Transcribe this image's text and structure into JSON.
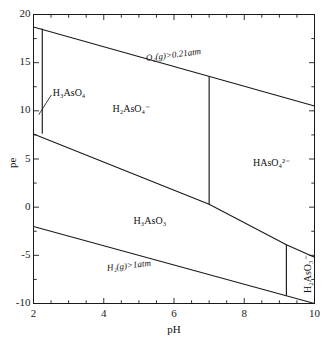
{
  "figure": {
    "ghost_text_top": "",
    "background": "#ffffff",
    "line_color": "#1a1a1a",
    "text_color": "#111111"
  },
  "chart_data": {
    "type": "line",
    "title": "",
    "subtitle": "",
    "xlabel": "pH",
    "ylabel": "pe",
    "xlim": [
      2,
      10
    ],
    "ylim": [
      -10,
      20
    ],
    "xticks": [
      2,
      4,
      6,
      8,
      10
    ],
    "xtick_labels": [
      "2",
      "4",
      "6",
      "8",
      "10"
    ],
    "yticks": [
      -10,
      -5,
      0,
      5,
      10,
      15,
      20
    ],
    "ytick_labels": [
      "-10",
      "-5",
      "0",
      "5",
      "10",
      "15",
      "20"
    ],
    "x_minor_step": 0.5,
    "y_minor_step": 2.5,
    "grid": false,
    "legend": "none",
    "series": [
      {
        "name": "O2(g) stability upper boundary",
        "style": "solid",
        "points": [
          [
            2,
            18.7
          ],
          [
            10,
            10.5
          ]
        ]
      },
      {
        "name": "H2(g) stability lower boundary",
        "style": "solid",
        "points": [
          [
            2,
            -2.0
          ],
          [
            10,
            -10.0
          ]
        ]
      },
      {
        "name": "As(V)/As(III) redox boundary",
        "style": "solid",
        "points": [
          [
            2,
            7.6
          ],
          [
            7.0,
            0.3
          ],
          [
            9.2,
            -3.9
          ],
          [
            10,
            -5.2
          ]
        ]
      },
      {
        "name": "H3AsO4 / H2AsO4- boundary (pKa1)",
        "style": "solid",
        "points": [
          [
            2.25,
            18.55
          ],
          [
            2.25,
            7.62
          ]
        ]
      },
      {
        "name": "H2AsO4- / HAsO4 2- boundary (pKa2)",
        "style": "solid",
        "points": [
          [
            7.0,
            13.6
          ],
          [
            7.0,
            0.3
          ]
        ]
      },
      {
        "name": "H3AsO3 / H2AsO3- boundary (pKa)",
        "style": "solid",
        "points": [
          [
            9.2,
            -3.9
          ],
          [
            9.2,
            -9.2
          ]
        ]
      }
    ],
    "annotations": [
      {
        "text": "H3AsO4",
        "label": "H₃AsO₄",
        "x": 2.55,
        "y": 11.9,
        "role": "species-label",
        "leader_to": [
          2.15,
          9.6
        ]
      },
      {
        "text": "H2AsO4-",
        "label": "H₂AsO₄⁻",
        "x": 4.25,
        "y": 10.2,
        "role": "species-label"
      },
      {
        "text": "HAsO4 2-",
        "label": "HAsO₄²⁻",
        "x": 8.25,
        "y": 4.6,
        "role": "species-label"
      },
      {
        "text": "H3AsO3",
        "label": "H₃AsO₃",
        "x": 4.85,
        "y": -1.4,
        "role": "species-label"
      },
      {
        "text": "H2AsO3-",
        "label": "H₂AsO₃⁻",
        "x": 9.55,
        "y": -6.6,
        "role": "species-label",
        "rotation": -90
      },
      {
        "text": "O2(g)>0.21atm",
        "label": "O₂(g)>0.21atm",
        "x": 5.2,
        "y": 15.4,
        "role": "boundary-label",
        "rotation": -7.2
      },
      {
        "text": "H2(g)>1atm",
        "label": "H₂(g)>1atm",
        "x": 4.1,
        "y": -6.4,
        "role": "boundary-label",
        "rotation": -7.0
      }
    ]
  }
}
